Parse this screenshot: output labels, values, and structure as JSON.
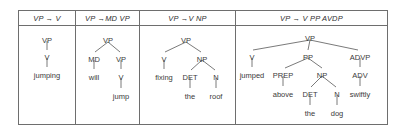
{
  "figure": {
    "kind": "syntax-tree-table",
    "columns": [
      {
        "id": "vp-v",
        "header": "VP → V",
        "tree": {
          "nodes": [
            {
              "label": "VP",
              "x": 28,
              "y": 10
            },
            {
              "label": "V",
              "x": 28,
              "y": 27
            },
            {
              "label": "jumping",
              "x": 28,
              "y": 45
            }
          ],
          "edges": [
            {
              "x1": 28,
              "y1": 15,
              "x2": 28,
              "y2": 24
            },
            {
              "x1": 28,
              "y1": 32,
              "x2": 28,
              "y2": 41
            }
          ]
        }
      },
      {
        "id": "vp-md-vp",
        "header": "VP →MD VP",
        "tree": {
          "nodes": [
            {
              "label": "VP",
              "x": 32,
              "y": 10
            },
            {
              "label": "MD",
              "x": 18,
              "y": 29
            },
            {
              "label": "VP",
              "x": 45,
              "y": 29
            },
            {
              "label": "will",
              "x": 18,
              "y": 47
            },
            {
              "label": "V",
              "x": 45,
              "y": 47
            },
            {
              "label": "jump",
              "x": 45,
              "y": 66
            }
          ],
          "edges": [
            {
              "x1": 32,
              "y1": 16,
              "x2": 19,
              "y2": 26
            },
            {
              "x1": 32,
              "y1": 16,
              "x2": 44,
              "y2": 26
            },
            {
              "x1": 18,
              "y1": 34,
              "x2": 18,
              "y2": 43
            },
            {
              "x1": 45,
              "y1": 34,
              "x2": 45,
              "y2": 43
            },
            {
              "x1": 45,
              "y1": 52,
              "x2": 45,
              "y2": 62
            }
          ]
        }
      },
      {
        "id": "vp-v-np",
        "header": "VP →V NP",
        "tree": {
          "nodes": [
            {
              "label": "VP",
              "x": 46,
              "y": 10
            },
            {
              "label": "V",
              "x": 24,
              "y": 29
            },
            {
              "label": "NP",
              "x": 62,
              "y": 29
            },
            {
              "label": "fixing",
              "x": 24,
              "y": 47
            },
            {
              "label": "DET",
              "x": 50,
              "y": 47
            },
            {
              "label": "N",
              "x": 76,
              "y": 47
            },
            {
              "label": "the",
              "x": 50,
              "y": 66
            },
            {
              "label": "roof",
              "x": 76,
              "y": 66
            }
          ],
          "edges": [
            {
              "x1": 46,
              "y1": 16,
              "x2": 25,
              "y2": 26
            },
            {
              "x1": 46,
              "y1": 16,
              "x2": 61,
              "y2": 26
            },
            {
              "x1": 24,
              "y1": 34,
              "x2": 24,
              "y2": 43
            },
            {
              "x1": 62,
              "y1": 34,
              "x2": 51,
              "y2": 44
            },
            {
              "x1": 62,
              "y1": 34,
              "x2": 75,
              "y2": 44
            },
            {
              "x1": 50,
              "y1": 52,
              "x2": 50,
              "y2": 62
            },
            {
              "x1": 76,
              "y1": 52,
              "x2": 76,
              "y2": 62
            }
          ]
        }
      },
      {
        "id": "vp-v-pp-advp",
        "header": "VP → V PP  AVDP",
        "tree": {
          "nodes": [
            {
              "label": "VP",
              "x": 74,
              "y": 8
            },
            {
              "label": "V",
              "x": 16,
              "y": 27
            },
            {
              "label": "PP",
              "x": 72,
              "y": 27
            },
            {
              "label": "ADVP",
              "x": 124,
              "y": 27
            },
            {
              "label": "jumped",
              "x": 16,
              "y": 45
            },
            {
              "label": "PREP",
              "x": 47,
              "y": 45
            },
            {
              "label": "NP",
              "x": 86,
              "y": 45
            },
            {
              "label": "ADV",
              "x": 124,
              "y": 45
            },
            {
              "label": "above",
              "x": 47,
              "y": 64
            },
            {
              "label": "DET",
              "x": 74,
              "y": 64
            },
            {
              "label": "N",
              "x": 101,
              "y": 64
            },
            {
              "label": "swiftly",
              "x": 124,
              "y": 64
            },
            {
              "label": "the",
              "x": 74,
              "y": 83
            },
            {
              "label": "dog",
              "x": 101,
              "y": 83
            }
          ],
          "edges": [
            {
              "x1": 74,
              "y1": 14,
              "x2": 17,
              "y2": 24
            },
            {
              "x1": 74,
              "y1": 14,
              "x2": 72,
              "y2": 24
            },
            {
              "x1": 74,
              "y1": 14,
              "x2": 122,
              "y2": 24
            },
            {
              "x1": 16,
              "y1": 32,
              "x2": 16,
              "y2": 41
            },
            {
              "x1": 72,
              "y1": 32,
              "x2": 49,
              "y2": 42
            },
            {
              "x1": 72,
              "y1": 32,
              "x2": 86,
              "y2": 42
            },
            {
              "x1": 124,
              "y1": 32,
              "x2": 124,
              "y2": 41
            },
            {
              "x1": 47,
              "y1": 50,
              "x2": 47,
              "y2": 60
            },
            {
              "x1": 86,
              "y1": 50,
              "x2": 75,
              "y2": 61
            },
            {
              "x1": 86,
              "y1": 50,
              "x2": 100,
              "y2": 61
            },
            {
              "x1": 124,
              "y1": 50,
              "x2": 124,
              "y2": 60
            },
            {
              "x1": 74,
              "y1": 69,
              "x2": 74,
              "y2": 79
            },
            {
              "x1": 101,
              "y1": 69,
              "x2": 101,
              "y2": 79
            }
          ]
        }
      }
    ]
  }
}
